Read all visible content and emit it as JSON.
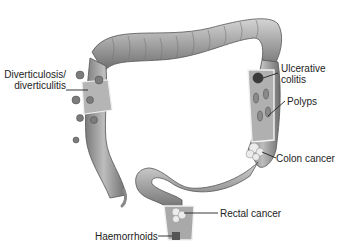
{
  "diagram": {
    "labels": {
      "diverticulosis_line1": "Diverticulosis/",
      "diverticulosis_line2": "diverticulitis",
      "ulcerative_line1": "Ulcerative",
      "ulcerative_line2": "colitis",
      "polyps": "Polyps",
      "colon_cancer": "Colon cancer",
      "rectal_cancer": "Rectal cancer",
      "haemorrhoids": "Haemorrhoids"
    },
    "colors": {
      "tissue": "#9a9a9a",
      "tissue_light": "#c8c8c8",
      "tissue_dark": "#6e6e6e",
      "text": "#222222",
      "background": "#ffffff"
    }
  }
}
